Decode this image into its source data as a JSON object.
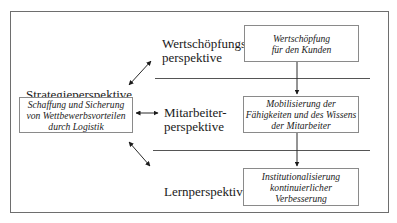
{
  "diagram": {
    "strategy": {
      "label": "Strategieperspektive",
      "box_text": "Schaffung und Sicherung\nvon Wettbewerbsvorteilen\ndurch Logistik"
    },
    "perspectives": [
      {
        "label": "Wertschöpfungs-\nperspektive",
        "box_text": "Wertschöpfung\nfür den Kunden"
      },
      {
        "label": "Mitarbeiter-\nperspektive",
        "box_text": "Mobilisierung der\nFähigkeiten und des Wissens\nder Mitarbeiter"
      },
      {
        "label": "Lernperspektive",
        "box_text": "Institutionalisierung\nkontinuierlicher\nVerbesserung"
      }
    ],
    "connectors": [
      {
        "from": "strategy",
        "to": "perspectives.0",
        "type": "double-arrow"
      },
      {
        "from": "strategy",
        "to": "perspectives.1",
        "type": "double-arrow"
      },
      {
        "from": "strategy",
        "to": "perspectives.2",
        "type": "double-arrow"
      },
      {
        "from": "perspectives.0",
        "to": "perspectives.1",
        "type": "arrow"
      },
      {
        "from": "perspectives.1",
        "to": "perspectives.2",
        "type": "arrow"
      }
    ]
  }
}
